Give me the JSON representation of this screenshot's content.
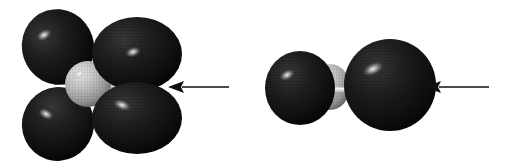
{
  "figure": {
    "title": "Space-filling molecular orbital models with indicator arrows",
    "background_color": "#ffffff",
    "width": 507,
    "height": 163,
    "lobe_color": "#171717",
    "lobe_color_light": "#2e2e2e",
    "lobe_color_dark": "#050505",
    "core_color": "#b6b6b6",
    "core_color_light": "#e2e2e2",
    "core_color_dark": "#6d6d6d",
    "bond_color": "#d8d8d8",
    "arrow_color": "#111111",
    "highlight_color": "#f2f2f2"
  },
  "structures": [
    {
      "id": "left-structure",
      "name": "four-lobe-orbital-model",
      "label": "Four-lobe orbital model with central atom",
      "center": {
        "x": 88,
        "y": 84
      },
      "core": {
        "name": "central-atom-sphere",
        "cx": 88,
        "cy": 84,
        "rx": 23,
        "ry": 23,
        "fill": "#b6b6b6"
      },
      "bond": {
        "name": "bond-rod",
        "x1": 88,
        "y1": 85,
        "x2": 152,
        "y2": 85,
        "width": 7,
        "fill": "#d8d8d8"
      },
      "lobes": [
        {
          "name": "lobe-upper-left",
          "cx": 58,
          "cy": 47,
          "rx": 36,
          "ry": 38,
          "rotate": -18,
          "highlight": {
            "cx": 44,
            "cy": 35,
            "rx": 8,
            "ry": 5,
            "rotate": -30
          }
        },
        {
          "name": "lobe-lower-left",
          "cx": 58,
          "cy": 124,
          "rx": 36,
          "ry": 37,
          "rotate": 18,
          "highlight": {
            "cx": 46,
            "cy": 114,
            "rx": 8,
            "ry": 5,
            "rotate": 28
          }
        },
        {
          "name": "lobe-upper-right",
          "cx": 137,
          "cy": 54,
          "rx": 45,
          "ry": 37,
          "rotate": 0,
          "highlight": {
            "cx": 133,
            "cy": 52,
            "rx": 8,
            "ry": 5,
            "rotate": -18
          }
        },
        {
          "name": "lobe-lower-right",
          "cx": 137,
          "cy": 118,
          "rx": 45,
          "ry": 36,
          "rotate": 0,
          "highlight": {
            "cx": 122,
            "cy": 105,
            "rx": 9,
            "ry": 5,
            "rotate": 20
          }
        }
      ],
      "arrow": {
        "name": "indicator-arrow-left-structure",
        "direction": "left",
        "tail_x": 229,
        "head_x": 168,
        "y": 87,
        "shaft_width": 1.6,
        "head_length": 16,
        "head_half_height": 6
      }
    },
    {
      "id": "right-structure",
      "name": "two-sphere-orbital-model",
      "label": "Two-sphere orbital model with hidden central atom",
      "core": {
        "name": "central-atom-sphere",
        "cx": 330,
        "cy": 87,
        "rx": 20,
        "ry": 23,
        "fill": "#b6b6b6"
      },
      "bond": {
        "name": "bond-rod",
        "x1": 318,
        "y1": 90,
        "x2": 372,
        "y2": 90,
        "width": 5,
        "fill": "#d8d8d8"
      },
      "lobes": [
        {
          "name": "sphere-left",
          "cx": 300,
          "cy": 88,
          "rx": 35,
          "ry": 37,
          "rotate": 0,
          "highlight": {
            "cx": 287,
            "cy": 75,
            "rx": 8,
            "ry": 5,
            "rotate": -28
          }
        },
        {
          "name": "sphere-right",
          "cx": 390,
          "cy": 85,
          "rx": 46,
          "ry": 46,
          "rotate": 0,
          "highlight": {
            "cx": 373,
            "cy": 69,
            "rx": 11,
            "ry": 6,
            "rotate": -25
          }
        }
      ],
      "arrow": {
        "name": "indicator-arrow-right-structure",
        "direction": "left",
        "tail_x": 489,
        "head_x": 425,
        "y": 87,
        "shaft_width": 1.6,
        "head_length": 16,
        "head_half_height": 6
      }
    }
  ]
}
